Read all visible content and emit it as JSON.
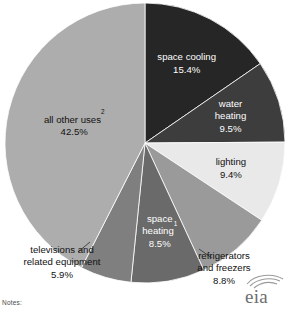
{
  "chart_data": {
    "type": "pie",
    "title": "",
    "subtitle": "",
    "xlabel": "",
    "ylabel": "",
    "legend_position": "none",
    "grid": false,
    "start_angle_deg": 0,
    "direction": "clockwise",
    "units": "percent",
    "total": 100.0,
    "categories": [
      "space cooling",
      "water heating",
      "lighting",
      "refrigerators and freezers",
      "space heating",
      "televisions and related equipment",
      "all other uses"
    ],
    "values": [
      15.4,
      9.5,
      9.4,
      8.8,
      8.5,
      5.9,
      42.5
    ],
    "slices": [
      {
        "id": "space-cooling",
        "label": "space cooling",
        "label_line1": "space cooling",
        "value": 15.4,
        "value_label": "15.4%",
        "color": "#262626",
        "label_placement": "inside",
        "label_color": "#ffffff",
        "footnote_marker": ""
      },
      {
        "id": "water-heating",
        "label": "water heating",
        "label_line1": "water",
        "label_line2": "heating",
        "value": 9.5,
        "value_label": "9.5%",
        "color": "#3d3d3d",
        "label_placement": "inside",
        "label_color": "#ffffff",
        "footnote_marker": ""
      },
      {
        "id": "lighting",
        "label": "lighting",
        "label_line1": "lighting",
        "value": 9.4,
        "value_label": "9.4%",
        "color": "#e9e9e9",
        "label_placement": "inside",
        "label_color": "#111111",
        "footnote_marker": ""
      },
      {
        "id": "refrigerators-and-freezers",
        "label": "refrigerators and freezers",
        "label_line1": "refrigerators",
        "label_line2": "and freezers",
        "value": 8.8,
        "value_label": "8.8%",
        "color": "#9a9a9a",
        "label_placement": "outside",
        "label_color": "#111111",
        "footnote_marker": ""
      },
      {
        "id": "space-heating",
        "label": "space heating",
        "label_line1": "space",
        "label_line2": "heating",
        "value": 8.5,
        "value_label": "8.5%",
        "color": "#6a6a6a",
        "label_placement": "inside",
        "label_color": "#ffffff",
        "footnote_marker": "1"
      },
      {
        "id": "televisions-and-related-equipment",
        "label": "televisions and related equipment",
        "label_line1": "televisions and",
        "label_line2": "related equipment",
        "value": 5.9,
        "value_label": "5.9%",
        "color": "#7f7f7f",
        "label_placement": "outside",
        "label_color": "#111111",
        "footnote_marker": ""
      },
      {
        "id": "all-other-uses",
        "label": "all other uses",
        "label_line1": "all other uses",
        "value": 42.5,
        "value_label": "42.5%",
        "color": "#adadad",
        "label_placement": "inside",
        "label_color": "#111111",
        "footnote_marker": "2"
      }
    ]
  },
  "footer": {
    "notes_label": "Notes:"
  },
  "logo": {
    "name": "eia-logo",
    "wordmark": "eia"
  }
}
